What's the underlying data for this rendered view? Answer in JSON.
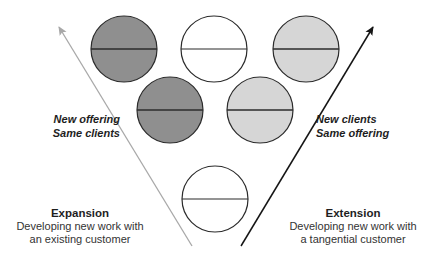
{
  "diagram": {
    "colors": {
      "dark_fill": "#8f8f8f",
      "light_fill": "#d6d6d6",
      "empty_fill": "#ffffff",
      "stroke": "#2b2b2b",
      "left_arrow": "#a8a8a8",
      "right_arrow": "#151515"
    },
    "circles": [
      {
        "id": "top-left",
        "cx": 124,
        "cy": 49,
        "r": 33,
        "fill": "dark"
      },
      {
        "id": "top-center",
        "cx": 214,
        "cy": 49,
        "r": 33,
        "fill": "empty"
      },
      {
        "id": "top-right",
        "cx": 306,
        "cy": 49,
        "r": 33,
        "fill": "light"
      },
      {
        "id": "mid-left",
        "cx": 170,
        "cy": 110,
        "r": 33,
        "fill": "dark"
      },
      {
        "id": "mid-right",
        "cx": 260,
        "cy": 110,
        "r": 33,
        "fill": "light"
      },
      {
        "id": "bottom",
        "cx": 215,
        "cy": 199,
        "r": 33,
        "fill": "empty"
      }
    ],
    "arrows": [
      {
        "id": "expansion-arrow",
        "x1": 192,
        "y1": 246,
        "x2": 59,
        "y2": 27,
        "color": "left_arrow"
      },
      {
        "id": "extension-arrow",
        "x1": 241,
        "y1": 246,
        "x2": 373,
        "y2": 27,
        "color": "right_arrow"
      }
    ],
    "left_axis_label": {
      "line1": "New offering",
      "line2": "Same clients"
    },
    "right_axis_label": {
      "line1": "New clients",
      "line2": "Same offering"
    },
    "expansion": {
      "title": "Expansion",
      "line1": "Developing new work with",
      "line2": "an existing customer"
    },
    "extension": {
      "title": "Extension",
      "line1": "Developing new work with",
      "line2": "a tangential customer"
    }
  }
}
